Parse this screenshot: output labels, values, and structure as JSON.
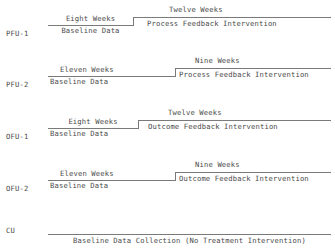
{
  "diagram": {
    "groups": [
      {
        "id": "PFU-1",
        "label": "PFU-1",
        "baseline": {
          "duration": "Eight Weeks",
          "activity": "Baseline Data"
        },
        "intervention": {
          "duration": "Twelve Weeks",
          "activity": "Process Feedback Intervention"
        }
      },
      {
        "id": "PFU-2",
        "label": "PFU-2",
        "baseline": {
          "duration": "Eleven Weeks",
          "activity": "Baseline Data"
        },
        "intervention": {
          "duration": "Nine Weeks",
          "activity": "Process Feedback Intervention"
        }
      },
      {
        "id": "OFU-1",
        "label": "OFU-1",
        "baseline": {
          "duration": "Eight Weeks",
          "activity": "Baseline Data"
        },
        "intervention": {
          "duration": "Twelve Weeks",
          "activity": "Outcome Feedback Intervention"
        }
      },
      {
        "id": "OFU-2",
        "label": "OFU-2",
        "baseline": {
          "duration": "Eleven Weeks",
          "activity": "Baseline Data"
        },
        "intervention": {
          "duration": "Nine Weeks",
          "activity": "Outcome Feedback Intervention"
        }
      }
    ],
    "control": {
      "id": "CU",
      "label": "CU",
      "activity": "Baseline Data Collection (No Treatment Intervention)"
    }
  }
}
